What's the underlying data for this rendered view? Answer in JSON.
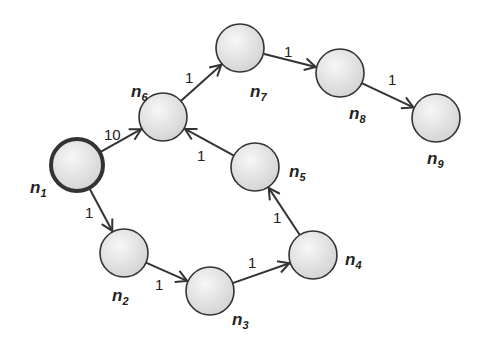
{
  "diagram": {
    "type": "directed-weighted-graph",
    "colors": {
      "node_fill_light": "#f2f2f2",
      "node_fill_dark": "#d6d6d6",
      "stroke": "#333333",
      "highlight_stroke": "#333333"
    },
    "nodes": [
      {
        "id": "n1",
        "label": "n",
        "sub": "1",
        "cx": 77,
        "cy": 165,
        "r": 26,
        "highlighted": true,
        "lx": 30,
        "ly": 193
      },
      {
        "id": "n2",
        "label": "n",
        "sub": "2",
        "cx": 124,
        "cy": 253,
        "r": 24,
        "highlighted": false,
        "lx": 112,
        "ly": 301
      },
      {
        "id": "n3",
        "label": "n",
        "sub": "3",
        "cx": 210,
        "cy": 291,
        "r": 24,
        "highlighted": false,
        "lx": 232,
        "ly": 325
      },
      {
        "id": "n4",
        "label": "n",
        "sub": "4",
        "cx": 313,
        "cy": 255,
        "r": 24,
        "highlighted": false,
        "lx": 345,
        "ly": 265
      },
      {
        "id": "n5",
        "label": "n",
        "sub": "5",
        "cx": 255,
        "cy": 167,
        "r": 24,
        "highlighted": false,
        "lx": 289,
        "ly": 177
      },
      {
        "id": "n6",
        "label": "n",
        "sub": "6",
        "cx": 163,
        "cy": 117,
        "r": 24,
        "highlighted": false,
        "lx": 131,
        "ly": 97
      },
      {
        "id": "n7",
        "label": "n",
        "sub": "7",
        "cx": 240,
        "cy": 48,
        "r": 24,
        "highlighted": false,
        "lx": 250,
        "ly": 97
      },
      {
        "id": "n8",
        "label": "n",
        "sub": "8",
        "cx": 340,
        "cy": 73,
        "r": 24,
        "highlighted": false,
        "lx": 349,
        "ly": 119
      },
      {
        "id": "n9",
        "label": "n",
        "sub": "9",
        "cx": 436,
        "cy": 118,
        "r": 24,
        "highlighted": false,
        "lx": 427,
        "ly": 164
      }
    ],
    "edges": [
      {
        "from": "n1",
        "to": "n6",
        "weight": "10",
        "lx": 104,
        "ly": 140
      },
      {
        "from": "n1",
        "to": "n2",
        "weight": "1",
        "lx": 85,
        "ly": 218
      },
      {
        "from": "n2",
        "to": "n3",
        "weight": "1",
        "lx": 155,
        "ly": 290
      },
      {
        "from": "n3",
        "to": "n4",
        "weight": "1",
        "lx": 248,
        "ly": 268
      },
      {
        "from": "n4",
        "to": "n5",
        "weight": "1",
        "lx": 273,
        "ly": 223
      },
      {
        "from": "n5",
        "to": "n6",
        "weight": "1",
        "lx": 197,
        "ly": 161
      },
      {
        "from": "n6",
        "to": "n7",
        "weight": "1",
        "lx": 185,
        "ly": 83
      },
      {
        "from": "n7",
        "to": "n8",
        "weight": "1",
        "lx": 284,
        "ly": 57
      },
      {
        "from": "n8",
        "to": "n9",
        "weight": "1",
        "lx": 388,
        "ly": 85
      }
    ]
  }
}
